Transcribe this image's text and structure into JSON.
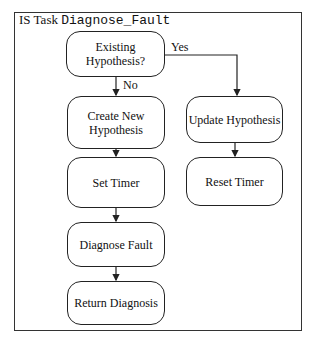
{
  "diagram": {
    "title_prefix": "IS Task ",
    "title_name": "Diagnose_Fault",
    "nodes": {
      "existing": "Existing Hypothesis?",
      "create": "Create New Hypothesis",
      "set_timer": "Set Timer",
      "diagnose": "Diagnose Fault",
      "return": "Return Diagnosis",
      "update": "Update Hypothesis",
      "reset": "Reset Timer"
    },
    "edge_labels": {
      "yes": "Yes",
      "no": "No"
    },
    "colors": {
      "stroke": "#222222",
      "background": "#ffffff"
    }
  }
}
